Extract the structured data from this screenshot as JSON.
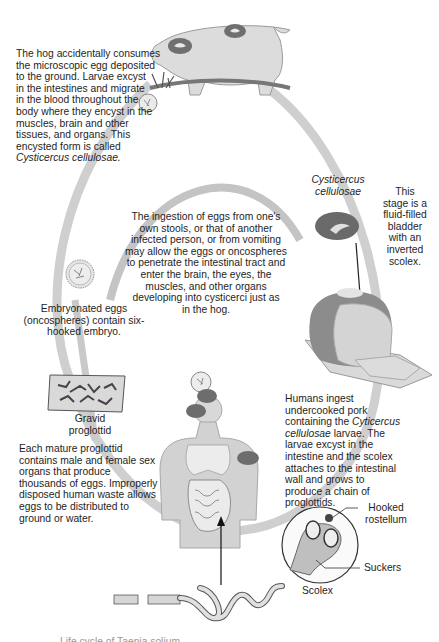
{
  "diagram": {
    "title_partial": "Life cycle of Taenia solium",
    "cycle_color": "#cfcfcf",
    "stages": {
      "hog": {
        "text_lines": [
          "The hog accidentally consumes",
          "the microscopic egg deposited",
          "to the ground. Larvae excyst",
          "in the intestines and migrate",
          "in the blood throughout the",
          "body where they encyst in the",
          "muscles, brain and other",
          "tissues, and organs. This",
          "encysted form is called"
        ],
        "italic_term": "Cysticercus cellulosae."
      },
      "autoinfection": {
        "text_lines": [
          "The ingestion of eggs from one's",
          "own stools, or that of another",
          "infected person, or from vomiting",
          "may allow the eggs or oncospheres",
          "to penetrate the intestinal tract and",
          "enter the brain, the eyes, the",
          "muscles, and other organs",
          "developing into cysticerci just as",
          "in the hog."
        ]
      },
      "cysticercus": {
        "name_lines": [
          "Cysticercus",
          "cellulosae"
        ],
        "desc_lines": [
          "This",
          "stage is a",
          "fluid-filled",
          "bladder",
          "with an",
          "inverted",
          "scolex."
        ]
      },
      "eggs": {
        "text_lines": [
          "Embryonated eggs",
          "(oncospheres) contain six-",
          "hooked embryo."
        ]
      },
      "proglottid": {
        "label_lines": [
          "Gravid",
          "proglottid"
        ],
        "text_lines": [
          "Each mature proglottid",
          "contains male and female sex",
          "organs that produce",
          "thousands of eggs. Improperly",
          "disposed human waste allows",
          "eggs to be distributed to",
          "ground or water."
        ]
      },
      "human": {
        "text_line1": "Humans ingest",
        "text_line2": "undercooked pork",
        "text_line3_pre": "containing the ",
        "text_line3_italic": "Cyticercus",
        "text_line4_italic": "cellulosae",
        "text_line4_post": " larvae. The",
        "text_lines_rest": [
          "larvae excyst in the",
          "intestine and the scolex",
          "attaches to the intestinal",
          "wall and grows to",
          "produce a chain of",
          "proglottids."
        ]
      },
      "scolex": {
        "label": "Scolex",
        "hooked_lines": [
          "Hooked",
          "rostellum"
        ],
        "suckers": "Suckers"
      }
    }
  }
}
